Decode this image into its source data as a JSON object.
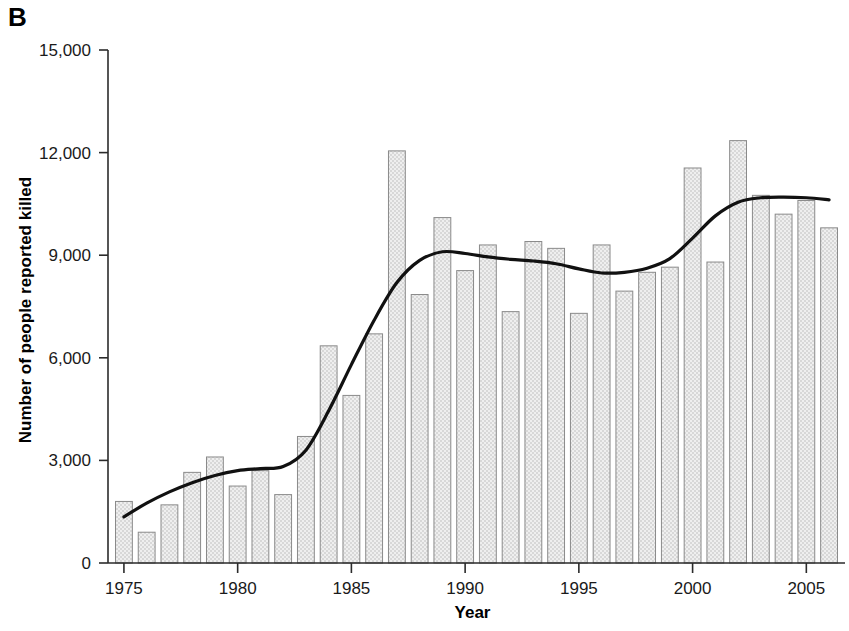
{
  "panel": {
    "label": "B"
  },
  "chart_data": {
    "type": "bar",
    "title": "",
    "subtitle": "",
    "xlabel": "Year",
    "ylabel": "Number of people reported killed",
    "grid": false,
    "legend": null,
    "legend_position": "none",
    "xlim": [
      1974.3,
      2006.7
    ],
    "ylim": [
      0,
      15000
    ],
    "ytick_values": [
      0,
      3000,
      6000,
      9000,
      12000,
      15000
    ],
    "ytick_labels": [
      "0",
      "3,000",
      "6,000",
      "9,000",
      "12,000",
      "15,000"
    ],
    "xtick_values": [
      1975,
      1980,
      1985,
      1990,
      1995,
      2000,
      2005
    ],
    "xtick_labels": [
      "1975",
      "1980",
      "1985",
      "1990",
      "1995",
      "2000",
      "2005"
    ],
    "categories": [
      1975,
      1976,
      1977,
      1978,
      1979,
      1980,
      1981,
      1982,
      1983,
      1984,
      1985,
      1986,
      1987,
      1988,
      1989,
      1990,
      1991,
      1992,
      1993,
      1994,
      1995,
      1996,
      1997,
      1998,
      1999,
      2000,
      2001,
      2002,
      2003,
      2004,
      2005,
      2006
    ],
    "values": [
      1800,
      900,
      1700,
      2650,
      3100,
      2250,
      2700,
      2000,
      3700,
      6350,
      4900,
      6700,
      12050,
      7850,
      10100,
      8550,
      9300,
      7350,
      9400,
      9200,
      7300,
      9300,
      7950,
      8500,
      8650,
      11550,
      8800,
      12350,
      10750,
      10200,
      10600,
      9800
    ],
    "series": [
      {
        "name": "Number of people reported killed",
        "type": "bar",
        "values": [
          1800,
          900,
          1700,
          2650,
          3100,
          2250,
          2700,
          2000,
          3700,
          6350,
          4900,
          6700,
          12050,
          7850,
          10100,
          8550,
          9300,
          7350,
          9400,
          9200,
          7300,
          9300,
          7950,
          8500,
          8650,
          11550,
          8800,
          12350,
          10750,
          10200,
          10600,
          9800
        ]
      },
      {
        "name": "Smoothed trend",
        "type": "line",
        "x": [
          1975,
          1976,
          1977,
          1978,
          1979,
          1980,
          1981,
          1982,
          1983,
          1984,
          1985,
          1986,
          1987,
          1988,
          1989,
          1990,
          1991,
          1992,
          1993,
          1994,
          1995,
          1996,
          1997,
          1998,
          1999,
          2000,
          2001,
          2002,
          2003,
          2004,
          2005,
          2006
        ],
        "values": [
          1350,
          1750,
          2080,
          2350,
          2560,
          2700,
          2760,
          2820,
          3300,
          4450,
          5800,
          7100,
          8200,
          8850,
          9100,
          9050,
          8950,
          8880,
          8830,
          8750,
          8600,
          8480,
          8500,
          8620,
          8900,
          9500,
          10150,
          10550,
          10680,
          10700,
          10680,
          10620
        ]
      }
    ],
    "bar_style": {
      "fill": "#eeeeee",
      "stipple": "#d2d2d2",
      "edge": "#8a8a8a"
    },
    "line_style": {
      "color": "#111111",
      "width": 3.2
    }
  }
}
